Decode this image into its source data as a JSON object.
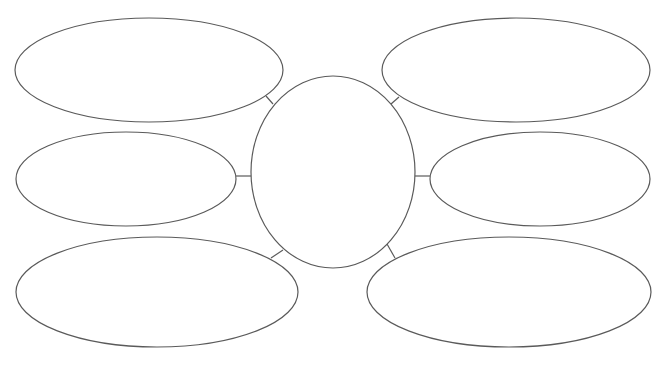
{
  "diagram": {
    "type": "bubble-map",
    "stroke_color": "#5a5a5a",
    "background": "#ffffff",
    "center": {
      "label": "",
      "cx": 333,
      "cy": 172,
      "rx": 82,
      "ry": 96
    },
    "bubbles": [
      {
        "id": "top-left",
        "label": "",
        "cx": 149,
        "cy": 70,
        "rx": 134,
        "ry": 52
      },
      {
        "id": "top-right",
        "label": "",
        "cx": 516,
        "cy": 70,
        "rx": 134,
        "ry": 52
      },
      {
        "id": "middle-left",
        "label": "",
        "cx": 126,
        "cy": 179,
        "rx": 110,
        "ry": 47
      },
      {
        "id": "middle-right",
        "label": "",
        "cx": 540,
        "cy": 179,
        "rx": 110,
        "ry": 47
      },
      {
        "id": "bottom-left",
        "label": "",
        "cx": 157,
        "cy": 292,
        "rx": 141,
        "ry": 55
      },
      {
        "id": "bottom-right",
        "label": "",
        "cx": 509,
        "cy": 292,
        "rx": 142,
        "ry": 55
      }
    ],
    "connectors": [
      {
        "from": "top-left",
        "x1": 266,
        "y1": 96,
        "x2": 273,
        "y2": 104
      },
      {
        "from": "top-right",
        "x1": 399,
        "y1": 97,
        "x2": 391,
        "y2": 104
      },
      {
        "from": "middle-left",
        "x1": 236,
        "y1": 176,
        "x2": 251,
        "y2": 176
      },
      {
        "from": "middle-right",
        "x1": 415,
        "y1": 176,
        "x2": 430,
        "y2": 176
      },
      {
        "from": "bottom-left",
        "x1": 271,
        "y1": 258,
        "x2": 283,
        "y2": 250
      },
      {
        "from": "bottom-right",
        "x1": 387,
        "y1": 244,
        "x2": 395,
        "y2": 258
      }
    ]
  }
}
